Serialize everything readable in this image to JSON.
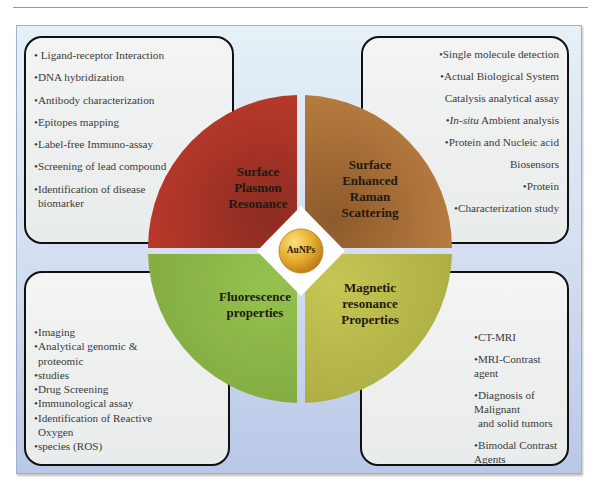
{
  "figure": {
    "center_label": "AuNPs",
    "quadrants": [
      {
        "id": "top-left",
        "title_lines": [
          "Surface",
          "Plasmon",
          "Resonance"
        ],
        "color": "#b0352a"
      },
      {
        "id": "top-right",
        "title_lines": [
          "Surface",
          "Enhanced",
          "Raman",
          "Scattering"
        ],
        "color": "#a8682e"
      },
      {
        "id": "bottom-left",
        "title_lines": [
          "Fluorescence",
          "properties"
        ],
        "color": "#8fb848"
      },
      {
        "id": "bottom-right",
        "title_lines": [
          "Magnetic",
          "resonance",
          "Properties"
        ],
        "color": "#b7b84c"
      }
    ],
    "boxes": {
      "top_left": [
        "• Ligand-receptor Interaction",
        "•DNA hybridization",
        "•Antibody characterization",
        "•Epitopes mapping",
        "•Label-free Immuno-assay",
        "•Screening of lead compound",
        "•Identification of disease",
        "biomarker"
      ],
      "top_right": [
        "•Single molecule detection",
        "•Actual Biological System",
        "Catalysis analytical assay",
        "In-situ",
        "Ambient analysis",
        "•Protein and Nucleic acid",
        "Biosensors",
        "•Protein",
        "•Characterization study"
      ],
      "bottom_left": [
        "•Imaging",
        "•Analytical genomic &",
        "proteomic",
        "•studies",
        "•Drug Screening",
        "•Immunological assay",
        "•Identification of Reactive",
        "Oxygen",
        "•species (ROS)"
      ],
      "bottom_right": [
        "•CT-MRI",
        "•MRI-Contrast agent",
        "•Diagnosis of Malignant",
        "and solid tumors",
        "•Bimodal Contrast Agents"
      ]
    }
  }
}
